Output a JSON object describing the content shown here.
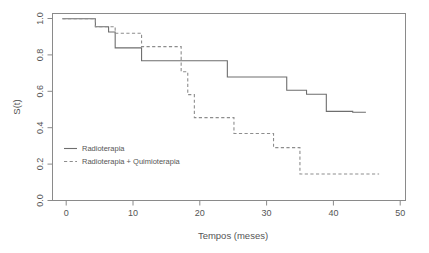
{
  "chart_data": {
    "type": "line",
    "title": "",
    "xlabel": "Tempos (meses)",
    "ylabel": "S(t)",
    "xlim": [
      -1.5,
      52
    ],
    "ylim": [
      -0.03,
      1.03
    ],
    "xticks": [
      0,
      10,
      20,
      30,
      40,
      50
    ],
    "xtick_labels": [
      "0",
      "10",
      "20",
      "30",
      "40",
      "50"
    ],
    "yticks": [
      0.0,
      0.2,
      0.4,
      0.6,
      0.8,
      1.0
    ],
    "ytick_labels": [
      "0.0",
      "0.2",
      "0.4",
      "0.6",
      "0.8",
      "1.0"
    ],
    "grid": false,
    "legend_position": "center-left",
    "step_style": "post",
    "series": [
      {
        "name": "Radioterapia",
        "line_style": "solid",
        "color": "#6e6e6e",
        "x": [
          0,
          5,
          7,
          8,
          12,
          24,
          25,
          33,
          34,
          37,
          40,
          44,
          46
        ],
        "y": [
          1.0,
          0.955,
          0.925,
          0.835,
          0.762,
          0.762,
          0.67,
          0.67,
          0.595,
          0.572,
          0.475,
          0.47,
          0.47
        ]
      },
      {
        "name": "Radioterapia + Quimioterapia",
        "line_style": "dashed",
        "color": "#8d8d8d",
        "x": [
          0,
          5,
          7,
          8,
          12,
          17,
          18,
          19,
          20,
          25,
          26,
          31,
          32,
          36,
          48
        ],
        "y": [
          1.0,
          0.955,
          0.955,
          0.918,
          0.842,
          0.842,
          0.7,
          0.57,
          0.44,
          0.44,
          0.35,
          0.35,
          0.27,
          0.12,
          0.12
        ]
      }
    ]
  },
  "legend": {
    "items": [
      {
        "label": "Radioterapia",
        "style": "solid"
      },
      {
        "label": "Radioterapia + Quimioterapia",
        "style": "dashed"
      }
    ]
  },
  "axes": {
    "x_title": "Tempos (meses)",
    "y_title": "S(t)"
  }
}
